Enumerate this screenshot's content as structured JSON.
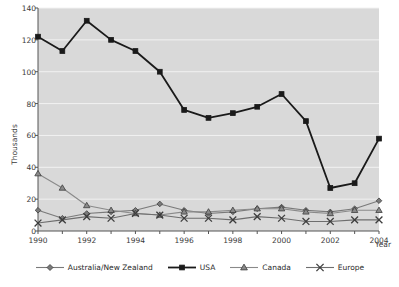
{
  "chart_data": {
    "type": "line",
    "title": "",
    "subtitle": "",
    "xlabel": "Year",
    "ylabel": "Thousands",
    "xlim": [
      1990,
      2004
    ],
    "ylim": [
      0,
      140
    ],
    "ytick_step": 20,
    "grid": true,
    "grid_axis": "y",
    "legend_position": "bottom",
    "plot_background": "#d9d9d9",
    "x": [
      1990,
      1991,
      1992,
      1993,
      1994,
      1995,
      1996,
      1997,
      1998,
      1999,
      2000,
      2001,
      2002,
      2003,
      2004
    ],
    "xtick_labels": [
      "1990",
      "1992",
      "1994",
      "1996",
      "1998",
      "2000",
      "2002",
      "2004"
    ],
    "ytick_labels": [
      "0",
      "20",
      "40",
      "60",
      "80",
      "100",
      "120",
      "140"
    ],
    "series": [
      {
        "name": "Australia/New Zealand",
        "marker": "diamond",
        "color": "#7a7a7a",
        "values": [
          13,
          8,
          11,
          12,
          13,
          17,
          13,
          11,
          12,
          14,
          15,
          13,
          12,
          14,
          19
        ]
      },
      {
        "name": "USA",
        "marker": "square",
        "color": "#1a1a1a",
        "values": [
          122,
          113,
          132,
          120,
          113,
          100,
          76,
          71,
          74,
          78,
          86,
          73,
          69,
          27,
          30
        ]
      },
      {
        "name": "Canada",
        "marker": "triangle",
        "color": "#8a8a8a",
        "values": [
          36,
          27,
          16,
          13,
          11,
          10,
          12,
          12,
          13,
          14,
          14,
          12,
          11,
          13,
          13
        ]
      },
      {
        "name": "Europe",
        "marker": "cross",
        "color": "#6e6e6e",
        "values": [
          5,
          7,
          9,
          8,
          11,
          10,
          8,
          8,
          7,
          9,
          8,
          6,
          6,
          7,
          7
        ]
      }
    ],
    "usa_actual": [
      122,
      113,
      132,
      120,
      113,
      100,
      76,
      71,
      74,
      78,
      86,
      73,
      69,
      27,
      30,
      58
    ]
  },
  "chart": {
    "ylabel": "Thousands",
    "xlabel": "Year"
  },
  "legend": {
    "items": [
      {
        "label": "Australia/New Zealand"
      },
      {
        "label": "USA"
      },
      {
        "label": "Canada"
      },
      {
        "label": "Europe"
      }
    ]
  }
}
